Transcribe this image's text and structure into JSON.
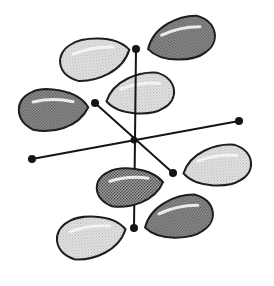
{
  "diagram": {
    "title": "Orbital lobes on three axes",
    "colors": {
      "background": "#ffffff",
      "outline": "#1e1e1e",
      "light_lobe": "#dcdcdc",
      "dark_lobe": "#8c8c8c",
      "axis": "#151515"
    },
    "center": {
      "x": 134,
      "y": 140
    },
    "axes": [
      {
        "name": "vertical-axis",
        "x1": 136,
        "y1": 49,
        "x2": 134,
        "y2": 228
      },
      {
        "name": "horizontal-axis",
        "x1": 32,
        "y1": 159,
        "x2": 239,
        "y2": 121
      },
      {
        "name": "diagonal-axis",
        "x1": 95,
        "y1": 103,
        "x2": 173,
        "y2": 173
      }
    ],
    "lobes": [
      {
        "name": "lobe-top-left",
        "shade": "light",
        "x0": 58,
        "x1": 130,
        "y0": 37,
        "y1": 80,
        "tip": "right",
        "rotate": -6
      },
      {
        "name": "lobe-top-right",
        "shade": "dark",
        "x0": 147,
        "x1": 217,
        "y0": 17,
        "y1": 61,
        "tip": "left",
        "rotate": -8
      },
      {
        "name": "lobe-mid-left",
        "shade": "dark",
        "x0": 17,
        "x1": 88,
        "y0": 88,
        "y1": 132,
        "tip": "right",
        "rotate": 4
      },
      {
        "name": "lobe-center",
        "shade": "light",
        "x0": 106,
        "x1": 176,
        "y0": 73,
        "y1": 115,
        "tip": "left",
        "rotate": -4
      },
      {
        "name": "lobe-right",
        "shade": "light",
        "x0": 183,
        "x1": 253,
        "y0": 145,
        "y1": 187,
        "tip": "left",
        "rotate": -4
      },
      {
        "name": "lobe-lower-center",
        "shade": "dark",
        "x0": 95,
        "x1": 163,
        "y0": 167,
        "y1": 207,
        "tip": "right",
        "rotate": 0
      },
      {
        "name": "lobe-lower-right",
        "shade": "dark",
        "x0": 144,
        "x1": 215,
        "y0": 196,
        "y1": 239,
        "tip": "left",
        "rotate": -8
      },
      {
        "name": "lobe-bottom-left",
        "shade": "light",
        "x0": 55,
        "x1": 126,
        "y0": 215,
        "y1": 259,
        "tip": "right",
        "rotate": -4
      }
    ]
  }
}
